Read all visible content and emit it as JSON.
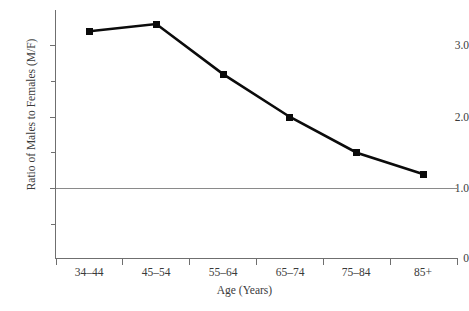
{
  "chart_data": {
    "type": "line",
    "title": "",
    "subtitle": "",
    "xlabel": "Age (Years)",
    "ylabel": "Ratio of Males to Females (M/F)",
    "categories": [
      "34–44",
      "45–54",
      "55–64",
      "65–74",
      "75–84",
      "85+"
    ],
    "values": [
      3.2,
      3.3,
      2.6,
      2.0,
      1.5,
      1.2
    ],
    "series": [
      {
        "name": "Ratio of Males to Females (M/F)",
        "values": [
          3.2,
          3.3,
          2.6,
          2.0,
          1.5,
          1.2
        ]
      }
    ],
    "ylim": [
      0,
      3.47
    ],
    "y_major_ticks": [
      1.0,
      2.0,
      3.0
    ],
    "y_major_tick_labels": [
      "1.0",
      "2.0",
      "3.0"
    ],
    "y_minor_ticks": [
      0.5,
      1.5,
      2.5
    ],
    "y_zero_label": "0",
    "grid": false,
    "legend": null,
    "annotations": [
      {
        "name": "reference-line",
        "type": "hline",
        "value": 1.0,
        "label": "",
        "color": "#8a8a8a"
      }
    ],
    "marker": "square",
    "line_color": "#0b0b0b",
    "marker_color": "#0b0b0b",
    "axis_color": "#6f6f6f",
    "background_color": "#ffffff"
  }
}
